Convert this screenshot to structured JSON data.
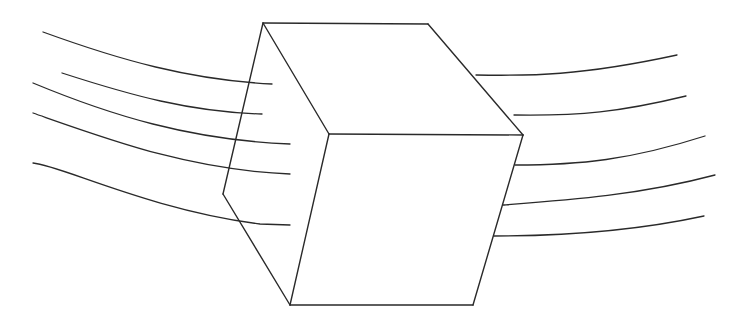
{
  "diagram": {
    "type": "line-drawing",
    "stroke_color": "#2a2a2a",
    "background_color": "#ffffff",
    "cube": {
      "edges": [
        {
          "name": "top-back-edge",
          "d": "M263 23 L428 24"
        },
        {
          "name": "top-right-edge",
          "d": "M428 24 L523 135"
        },
        {
          "name": "top-left-diagonal",
          "d": "M263 23 L329 134"
        },
        {
          "name": "front-top-edge",
          "d": "M329 134 L523 135"
        },
        {
          "name": "back-left-edge",
          "d": "M263 23 L223 194"
        },
        {
          "name": "left-bottom-diagonal",
          "d": "M223 194 L290 305"
        },
        {
          "name": "front-left-edge",
          "d": "M329 134 L290 305"
        },
        {
          "name": "front-bottom-edge",
          "d": "M290 305 L473 305"
        },
        {
          "name": "front-right-edge",
          "d": "M523 135 L473 305"
        }
      ]
    },
    "flow_lines_left": [
      {
        "d": "M43 32 C120 60, 190 80, 272 84"
      },
      {
        "d": "M62 73 C130 95, 190 112, 262 114"
      },
      {
        "d": "M33 83 C110 115, 190 140, 290 144"
      },
      {
        "d": "M33 113 C110 140, 190 170, 290 174"
      },
      {
        "d": "M33 163 C60 165, 150 210, 260 224 L290 225"
      }
    ],
    "flow_lines_right": [
      {
        "d": "M476 75 C530 76, 580 76, 677 55"
      },
      {
        "d": "M514 115 C580 116, 620 112, 686 96"
      },
      {
        "d": "M515 165 C580 165, 630 160, 705 136"
      },
      {
        "d": "M503 205 C570 200, 640 195, 715 175"
      },
      {
        "d": "M494 236 C560 236, 630 232, 704 216"
      }
    ]
  }
}
